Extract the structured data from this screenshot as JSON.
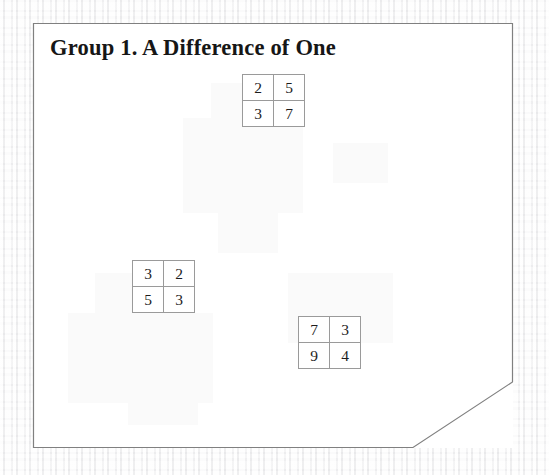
{
  "document": {
    "title": "Group 1. A Difference of One",
    "page_background_color": "#ffffff",
    "canvas_background_color": "#f6f6f6",
    "border_color": "#808080",
    "grid_line_color": "#9a9a9a",
    "text_color": "#161616",
    "corner_clipped": "bottom-right"
  },
  "grids": [
    {
      "name": "grid-1",
      "position": {
        "left": 209,
        "top": 51
      },
      "rows": [
        [
          "2",
          "5"
        ],
        [
          "3",
          "7"
        ]
      ]
    },
    {
      "name": "grid-2",
      "position": {
        "left": 99,
        "top": 237
      },
      "rows": [
        [
          "3",
          "2"
        ],
        [
          "5",
          "3"
        ]
      ]
    },
    {
      "name": "grid-3",
      "position": {
        "left": 265,
        "top": 293
      },
      "rows": [
        [
          "7",
          "3"
        ],
        [
          "9",
          "4"
        ]
      ]
    }
  ]
}
